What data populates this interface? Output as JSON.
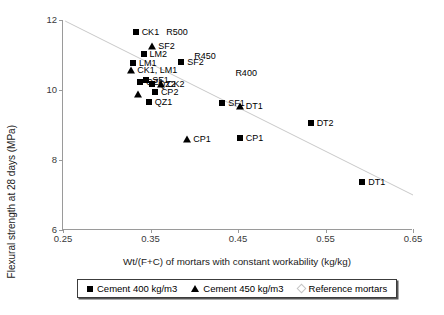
{
  "chart_data": {
    "type": "scatter",
    "title": "",
    "xlabel": "Wt/(F+C) of mortars with constant workability (kg/kg)",
    "ylabel": "Flexural strength at 28 days (MPa)",
    "xlim": [
      0.25,
      0.65
    ],
    "ylim": [
      6,
      12
    ],
    "xticks": [
      "0.25",
      "0.35",
      "0.45",
      "0.55",
      "0.65"
    ],
    "xtick_values": [
      0.25,
      0.35,
      0.45,
      0.55,
      0.65
    ],
    "yticks": [
      "6",
      "8",
      "10",
      "12"
    ],
    "ytick_values": [
      6,
      8,
      10,
      12
    ],
    "grid": false,
    "legend_position": "below-axes",
    "series": [
      {
        "name": "Cement 400 kg/m3",
        "marker": "filled-square",
        "points": [
          {
            "label": "CK1",
            "x": 0.333,
            "y": 11.67
          },
          {
            "label": "LM2",
            "x": 0.342,
            "y": 11.02
          },
          {
            "label": "LM1",
            "x": 0.33,
            "y": 10.78
          },
          {
            "label": "SF2",
            "x": 0.385,
            "y": 10.8
          },
          {
            "label": "QZ1",
            "x": 0.338,
            "y": 10.24
          },
          {
            "label": "SF1",
            "x": 0.345,
            "y": 10.28
          },
          {
            "label": "QZ2",
            "x": 0.352,
            "y": 10.18
          },
          {
            "label": "CP2",
            "x": 0.355,
            "y": 9.93
          },
          {
            "label": "QZ1",
            "x": 0.348,
            "y": 9.65
          },
          {
            "label": "SF1",
            "x": 0.432,
            "y": 9.62
          },
          {
            "label": "CP1",
            "x": 0.452,
            "y": 8.62
          },
          {
            "label": "DT2",
            "x": 0.533,
            "y": 9.07
          },
          {
            "label": "DT1",
            "x": 0.592,
            "y": 7.38
          }
        ]
      },
      {
        "name": "Cement 450 kg/m3",
        "marker": "filled-triangle",
        "points": [
          {
            "label": "SF2",
            "x": 0.352,
            "y": 11.27
          },
          {
            "label": "CK1, LM1",
            "x": 0.328,
            "y": 10.58
          },
          {
            "label": "CK2",
            "x": 0.362,
            "y": 10.18
          },
          {
            "label": "",
            "x": 0.336,
            "y": 9.88
          },
          {
            "label": "CP1",
            "x": 0.392,
            "y": 8.6
          },
          {
            "label": "DT1",
            "x": 0.452,
            "y": 9.55
          }
        ]
      },
      {
        "name": "Reference mortars",
        "marker": "open-diamond",
        "points": []
      }
    ],
    "trendline": {
      "annotations": [
        "R500",
        "R450",
        "R400"
      ],
      "x_start": 0.2525,
      "y_start": 11.97,
      "x_end": 0.65,
      "y_end": 7.0
    },
    "annotations": [
      {
        "text": "R500",
        "x": 0.368,
        "y": 11.67
      },
      {
        "text": "R450",
        "x": 0.4,
        "y": 10.97
      },
      {
        "text": "R400",
        "x": 0.447,
        "y": 10.48
      }
    ]
  },
  "legend": {
    "items": [
      {
        "label": "Cement 400 kg/m3",
        "marker": "filled-square"
      },
      {
        "label": "Cement 450 kg/m3",
        "marker": "filled-triangle"
      },
      {
        "label": "Reference mortars",
        "marker": "open-diamond"
      }
    ]
  }
}
